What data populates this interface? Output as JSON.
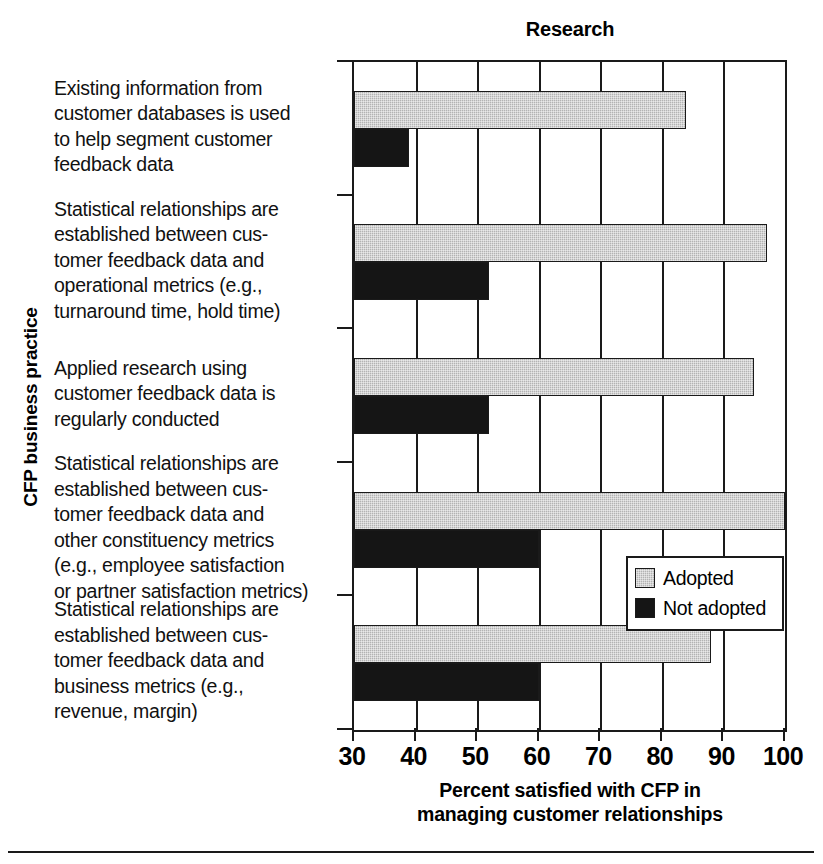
{
  "chart_data": {
    "type": "bar",
    "orientation": "horizontal",
    "title": "Research",
    "xlabel": "Percent satisfied with CFP in managing customer relationships",
    "xlabel_lines": [
      "Percent satisfied with CFP in",
      "managing customer relationships"
    ],
    "ylabel": "CFP business practice",
    "xlim": [
      30,
      100
    ],
    "xticks": [
      30,
      40,
      50,
      60,
      70,
      80,
      90,
      100
    ],
    "xticklabels": [
      "30",
      "40",
      "50",
      "60",
      "70",
      "80",
      "90",
      "100"
    ],
    "grid": "vertical",
    "legend_position": "center-right-inside",
    "categories": [
      "Existing information from customer databases is used to help segment customer feedback data",
      "Statistical relationships are established between customer feedback data and operational metrics (e.g., turnaround time, hold time)",
      "Applied research using customer feedback data is regularly conducted",
      "Statistical relationships are established between customer feedback data and other constituency metrics (e.g., employee satisfaction or partner satisfaction metrics)",
      "Statistical relationships are established between customer feedback data and business metrics (e.g., revenue, margin)"
    ],
    "category_lines": [
      [
        "Existing information from",
        "customer databases is used",
        "to help segment customer",
        "feedback data"
      ],
      [
        "Statistical relationships are",
        "established between cus-",
        "tomer feedback data and",
        "operational metrics (e.g.,",
        "turnaround time, hold time)"
      ],
      [
        "Applied research using",
        "customer feedback data is",
        "regularly conducted"
      ],
      [
        "Statistical relationships are",
        "established between cus-",
        "tomer feedback data and",
        "other constituency metrics",
        "(e.g., employee satisfaction",
        "or partner satisfaction metrics)"
      ],
      [
        "Statistical relationships are",
        "established between cus-",
        "tomer feedback data and",
        "business metrics (e.g.,",
        "revenue, margin)"
      ]
    ],
    "series": [
      {
        "name": "Adopted",
        "color": "#b3b3b3",
        "values": [
          84,
          97,
          95,
          100,
          88
        ]
      },
      {
        "name": "Not adopted",
        "color": "#151515",
        "values": [
          39,
          52,
          52,
          60,
          60
        ]
      }
    ]
  },
  "legend": {
    "items": [
      {
        "label": "Adopted",
        "swatch": "adopted"
      },
      {
        "label": "Not adopted",
        "swatch": "notadopted"
      }
    ]
  }
}
